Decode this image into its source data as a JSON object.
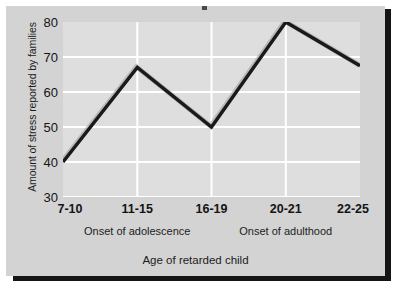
{
  "chart_data": {
    "type": "line",
    "title": "",
    "xlabel": "Age of retarded child",
    "ylabel": "Amount of stress reported by families",
    "categories": [
      "7-10",
      "11-15",
      "16-19",
      "20-21",
      "22-25"
    ],
    "values": [
      40,
      67,
      50,
      80,
      67.5
    ],
    "series": [
      {
        "name": "Amount of stress reported by families",
        "values": [
          40,
          67,
          50,
          80,
          67.5
        ]
      }
    ],
    "ylim": [
      30,
      80
    ],
    "yticks": [
      30,
      40,
      50,
      60,
      70,
      80
    ],
    "ytick_labels": [
      "30",
      "40",
      "50",
      "60",
      "70",
      "80"
    ],
    "grid": true,
    "grid_color": "#ffffff",
    "legend": "none",
    "line_color": "#1a1a1a",
    "plot_background": "#dedede",
    "figure_background": "#d3d3d3",
    "annotations": [
      {
        "text": "Onset of adolescence",
        "at_category": "11-15"
      },
      {
        "text": "Onset of adulthood",
        "at_category": "20-21"
      }
    ]
  },
  "axes": {
    "y_title": "Amount of stress reported by families",
    "x_title": "Age of retarded child"
  },
  "onset_labels": [
    {
      "text": "Onset of adolescence"
    },
    {
      "text": "Onset of adulthood"
    }
  ]
}
